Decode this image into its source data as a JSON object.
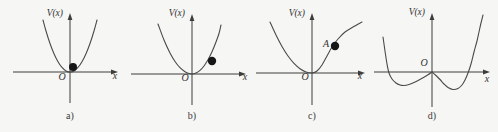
{
  "figure": {
    "background": "#f6f6f4",
    "ink": "#3d3d3d",
    "curve_color": "#4a4a4a",
    "text_color": "#333333",
    "ball_color": "#161616"
  },
  "chart_data": [
    {
      "panel": "a",
      "type": "line",
      "caption": "a)",
      "xlabel": "x",
      "ylabel": "V(x)",
      "origin_label": "O",
      "origin": [
        70,
        72
      ],
      "axis_extent": {
        "left": 57,
        "right": 48,
        "up": 59,
        "down": 31
      },
      "curve": [
        [
          -27,
          52
        ],
        [
          -24,
          41
        ],
        [
          -20,
          28.5
        ],
        [
          -16,
          18.3
        ],
        [
          -12,
          10.3
        ],
        [
          -8,
          4.6
        ],
        [
          -4,
          1.1
        ],
        [
          0,
          0
        ],
        [
          4,
          1.1
        ],
        [
          8,
          4.6
        ],
        [
          12,
          10.3
        ],
        [
          16,
          18.3
        ],
        [
          20,
          28.5
        ],
        [
          24,
          41
        ],
        [
          27,
          52
        ]
      ],
      "curve2": null,
      "ball": {
        "x": 3,
        "v": 5,
        "r": 4,
        "label": ""
      },
      "ball_label_offset": [
        0,
        0
      ],
      "origin_label_offset": [
        -8,
        8
      ],
      "xlabel_offset": [
        45,
        7
      ],
      "ylabel_offset": [
        -7,
        -56
      ]
    },
    {
      "panel": "b",
      "type": "line",
      "caption": "b)",
      "xlabel": "x",
      "ylabel": "V(x)",
      "origin_label": "O",
      "origin": [
        68,
        74
      ],
      "axis_extent": {
        "left": 61,
        "right": 54,
        "up": 60,
        "down": 31
      },
      "curve": [
        [
          -34,
          50
        ],
        [
          -28,
          34
        ],
        [
          -22,
          21
        ],
        [
          -17,
          12.5
        ],
        [
          -12,
          6.3
        ],
        [
          -7,
          2.2
        ],
        [
          -3,
          0.4
        ],
        [
          0,
          0
        ],
        [
          4,
          1
        ],
        [
          8,
          3.6
        ],
        [
          12,
          8
        ],
        [
          16,
          14.2
        ],
        [
          20,
          22.2
        ],
        [
          24,
          32
        ],
        [
          27,
          40.5
        ],
        [
          29,
          49
        ]
      ],
      "curve2": null,
      "ball": {
        "x": 20,
        "v": 13,
        "r": 4.2,
        "label": ""
      },
      "ball_label_offset": [
        0,
        0
      ],
      "origin_label_offset": [
        -7,
        7
      ],
      "xlabel_offset": [
        53,
        6
      ],
      "ylabel_offset": [
        -7,
        -58
      ]
    },
    {
      "panel": "c",
      "type": "line",
      "caption": "c)",
      "xlabel": "x",
      "ylabel": "V(x)",
      "origin_label": "O",
      "origin": [
        64,
        73
      ],
      "axis_extent": {
        "left": 56,
        "right": 53,
        "up": 60,
        "down": 32
      },
      "curve": [
        [
          -42,
          51
        ],
        [
          -36,
          38
        ],
        [
          -30,
          26.5
        ],
        [
          -24,
          17
        ],
        [
          -18,
          9.6
        ],
        [
          -12,
          4.3
        ],
        [
          -6,
          1.1
        ],
        [
          0,
          0
        ],
        [
          5,
          2
        ],
        [
          10,
          8
        ],
        [
          15,
          17
        ],
        [
          20,
          26
        ],
        [
          26,
          34
        ],
        [
          33,
          41
        ],
        [
          41,
          46
        ],
        [
          50,
          51
        ]
      ],
      "curve2": null,
      "ball": {
        "x": 23,
        "v": 27,
        "r": 4.2,
        "label": "A"
      },
      "ball_label_offset": [
        -6,
        1
      ],
      "origin_label_offset": [
        -7,
        7
      ],
      "xlabel_offset": [
        48,
        6
      ],
      "ylabel_offset": [
        -7,
        -57
      ]
    },
    {
      "panel": "d",
      "type": "line",
      "caption": "d)",
      "xlabel": "x",
      "ylabel": "V(x)",
      "origin_label": "O",
      "origin": [
        60,
        72
      ],
      "axis_extent": {
        "left": 58,
        "right": 58,
        "up": 59,
        "down": 35
      },
      "curve": [
        [
          -49,
          35
        ],
        [
          -47,
          21
        ],
        [
          -45,
          8
        ],
        [
          -43,
          -1
        ],
        [
          -40,
          -7
        ],
        [
          -36,
          -11
        ],
        [
          -32,
          -13
        ],
        [
          -28,
          -13.5
        ],
        [
          -23,
          -12.5
        ],
        [
          -18,
          -10.5
        ],
        [
          -13,
          -8
        ],
        [
          -8,
          -5.2
        ],
        [
          -4,
          -2.8
        ],
        [
          0,
          0
        ]
      ],
      "curve2": [
        [
          0,
          0
        ],
        [
          4,
          -3.5
        ],
        [
          8,
          -7.5
        ],
        [
          12,
          -12
        ],
        [
          16,
          -15.5
        ],
        [
          21,
          -17.5
        ],
        [
          26,
          -16.5
        ],
        [
          30,
          -13
        ],
        [
          33,
          -8
        ],
        [
          36,
          -1
        ],
        [
          39,
          8
        ],
        [
          42,
          20
        ],
        [
          45,
          31
        ],
        [
          47,
          40
        ],
        [
          49,
          49
        ],
        [
          51,
          57
        ]
      ],
      "ball": null,
      "ball_label_offset": [
        0,
        0
      ],
      "origin_label_offset": [
        -8,
        -6
      ],
      "xlabel_offset": [
        55,
        10
      ],
      "ylabel_offset": [
        -7,
        -57
      ]
    }
  ],
  "panel_widths": [
    124,
    124,
    124,
    126
  ]
}
